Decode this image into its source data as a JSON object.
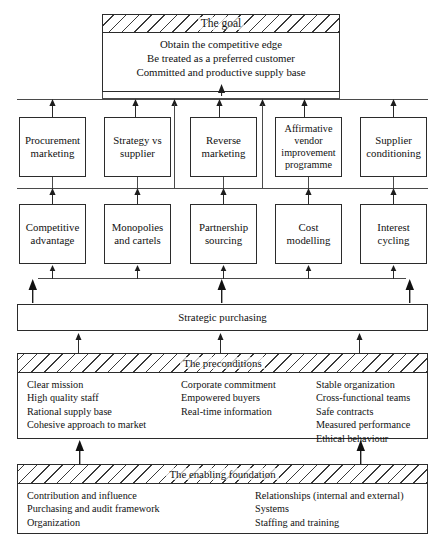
{
  "diagram": {
    "title_flow": "strategic purchasing pyramid",
    "goal": {
      "band_label": "The goal",
      "lines": [
        "Obtain the competitive edge",
        "Be treated as a preferred customer",
        "Committed and productive supply base"
      ]
    },
    "tier_upper": [
      {
        "label": "Procurement\nmarketing",
        "line1": "Procurement",
        "line2": "marketing",
        "line3": "",
        "line4": ""
      },
      {
        "label": "Strategy vs supplier",
        "line1": "Strategy vs",
        "line2": "supplier",
        "line3": "",
        "line4": ""
      },
      {
        "label": "Reverse marketing",
        "line1": "Reverse",
        "line2": "marketing",
        "line3": "",
        "line4": ""
      },
      {
        "label": "Affirmative vendor improvement programme",
        "line1": "Affirmative",
        "line2": "vendor",
        "line3": "improvement",
        "line4": "programme"
      },
      {
        "label": "Supplier conditioning",
        "line1": "Supplier",
        "line2": "conditioning",
        "line3": "",
        "line4": ""
      }
    ],
    "tier_lower": [
      {
        "line1": "Competitive",
        "line2": "advantage"
      },
      {
        "line1": "Monopolies",
        "line2": "and cartels"
      },
      {
        "line1": "Partnership",
        "line2": "sourcing"
      },
      {
        "line1": "Cost",
        "line2": "modelling"
      },
      {
        "line1": "Interest",
        "line2": "cycling"
      }
    ],
    "strategic_bar": {
      "label": "Strategic purchasing"
    },
    "preconditions": {
      "band_label": "The preconditions",
      "columns": [
        {
          "items": [
            "Clear mission",
            "High quality staff",
            "Rational supply base",
            "Cohesive approach to market"
          ]
        },
        {
          "items": [
            "Corporate commitment",
            "Empowered buyers",
            "Real-time information"
          ]
        },
        {
          "items": [
            "Stable organization",
            "Cross-functional teams",
            "Safe contracts",
            "Measured performance",
            "Ethical behaviour"
          ]
        }
      ]
    },
    "foundation": {
      "band_label": "The enabling foundation",
      "columns": [
        {
          "items": [
            "Contribution and influence",
            "Purchasing and audit framework",
            "Organization"
          ]
        },
        {
          "items": [
            "Relationships (internal and external)",
            "Systems",
            "Staffing and training"
          ]
        }
      ]
    },
    "colors": {
      "stroke": "#2b2b2b",
      "connector": "#4a4a4a",
      "background": "#ffffff",
      "text": "#111111"
    }
  }
}
